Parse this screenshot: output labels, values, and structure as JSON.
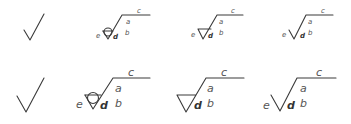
{
  "diagram": {
    "rows": [
      {
        "size": "small",
        "symbols": [
          {
            "type": "basic-check",
            "labels": {}
          },
          {
            "type": "circle-lay",
            "labels": {
              "a": "a",
              "b": "b",
              "c": "c",
              "d": "d",
              "e": "e"
            }
          },
          {
            "type": "material-removal-required",
            "labels": {
              "a": "a",
              "b": "b",
              "c": "c",
              "d": "d",
              "e": "e"
            }
          },
          {
            "type": "basic-extended",
            "labels": {
              "a": "a",
              "b": "b",
              "c": "c",
              "d": "d",
              "e": "e"
            }
          }
        ]
      },
      {
        "size": "large",
        "symbols": [
          {
            "type": "basic-check",
            "labels": {}
          },
          {
            "type": "circle-lay",
            "labels": {
              "a": "a",
              "b": "b",
              "c": "c",
              "d": "d",
              "e": "e"
            }
          },
          {
            "type": "material-removal-required",
            "labels": {
              "a": "a",
              "b": "b",
              "c": "c",
              "d": "d"
            }
          },
          {
            "type": "basic-extended",
            "labels": {
              "a": "a",
              "b": "b",
              "c": "c",
              "d": "d",
              "e": "e"
            }
          }
        ]
      }
    ]
  }
}
